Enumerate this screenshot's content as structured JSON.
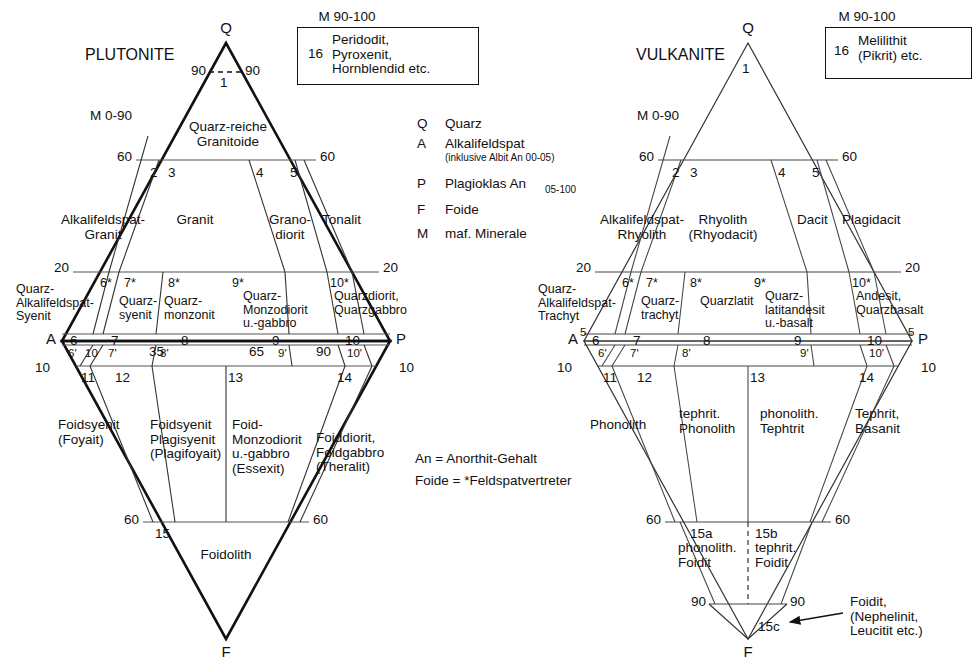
{
  "figure": {
    "type": "qapf-double-triangle",
    "left_diagram_title": "PLUTONITE",
    "right_diagram_title": "VULKANITE"
  },
  "legend": {
    "entries": [
      {
        "key": "Q",
        "text": "Quarz",
        "sub": ""
      },
      {
        "key": "A",
        "text": "Alkalifeldspat",
        "sub": "(inklusive Albit An 00-05)"
      },
      {
        "key": "P",
        "text": "Plagioklas An",
        "sub": "05-100"
      },
      {
        "key": "F",
        "text": "Foide",
        "sub": ""
      },
      {
        "key": "M",
        "text": "maf. Minerale",
        "sub": ""
      }
    ],
    "notes": [
      "An = Anorthit-Gehalt",
      "Foide = *Feldspatvertreter"
    ]
  },
  "left": {
    "title": "PLUTONITE",
    "m_top": "M 90-100",
    "m_mid": "M 0-90",
    "box_number": "16",
    "box_text": "Peridodit,\nPyroxenit,\nHornblendid etc.",
    "vertices": {
      "Q": "Q",
      "A": "A",
      "P": "P",
      "F": "F"
    },
    "ticks": {
      "q90_left": "90",
      "q90_right": "90",
      "q60_left": "60",
      "q60_right": "60",
      "q20_left": "20",
      "q20_right": "20",
      "f10_left": "10",
      "f10_right": "10",
      "f60_left": "60",
      "f60_right": "60",
      "ap_35": "35",
      "ap_65": "65",
      "ap_90": "90",
      "ap_10_left": "10"
    },
    "fields": [
      {
        "num": "1",
        "name": ""
      },
      {
        "num": "2",
        "name": "Alkalifeldspat-\nGranit"
      },
      {
        "num": "3",
        "name": "Granit"
      },
      {
        "num": "4",
        "name": "Grano-\ndiorit"
      },
      {
        "num": "5",
        "name": "Tonalit"
      },
      {
        "num": "6*",
        "name": "Quarz-\nAlkalifeldspat-\nSyenit"
      },
      {
        "num": "7*",
        "name": "Quarz-\nsyenit"
      },
      {
        "num": "8*",
        "name": "Quarz-\nmonzonit"
      },
      {
        "num": "9*",
        "name": "Quarz-\nMonzodiorit\nu.-gabbro"
      },
      {
        "num": "10*",
        "name": "Quarzdiorit,\nQuarzgabbro"
      },
      {
        "num": "6",
        "name": ""
      },
      {
        "num": "7",
        "name": ""
      },
      {
        "num": "8",
        "name": ""
      },
      {
        "num": "9",
        "name": ""
      },
      {
        "num": "10",
        "name": ""
      },
      {
        "num": "6'",
        "name": ""
      },
      {
        "num": "7'",
        "name": ""
      },
      {
        "num": "8'",
        "name": ""
      },
      {
        "num": "9'",
        "name": ""
      },
      {
        "num": "10'",
        "name": ""
      },
      {
        "num": "11",
        "name": "Foidsyenit\n(Foyait)"
      },
      {
        "num": "12",
        "name": "Foidsyenit\nPlagisyenit\n(Plagifoyait)"
      },
      {
        "num": "13",
        "name": "Foid-\nMonzodiorit\nu.-gabbro\n(Essexit)"
      },
      {
        "num": "14",
        "name": "Foiddiorit,\nFoidgabbro\n(Theralit)"
      },
      {
        "num": "15",
        "name": "Foidolith"
      }
    ],
    "top_field_label": "Quarz-reiche\nGranitoide"
  },
  "right": {
    "title": "VULKANITE",
    "m_top": "M 90-100",
    "m_mid": "M 0-90",
    "box_number": "16",
    "box_text": "Melilithit\n(Pikrit) etc.",
    "vertices": {
      "Q": "Q",
      "A": "A",
      "P": "P",
      "F": "F"
    },
    "ticks": {
      "q60_left": "60",
      "q60_right": "60",
      "q20_left": "20",
      "q20_right": "20",
      "a5": "5",
      "p5": "5",
      "f10_left": "10",
      "f10_right": "10",
      "f60_left": "60",
      "f60_right": "60",
      "f90_left": "90",
      "f90_right": "90"
    },
    "fields": [
      {
        "num": "1",
        "name": ""
      },
      {
        "num": "2",
        "name": "Alkalifeldspat-\nRhyolith"
      },
      {
        "num": "3",
        "name": "Rhyolith\n(Rhyodacit)"
      },
      {
        "num": "4",
        "name": "Dacit"
      },
      {
        "num": "5",
        "name": "Plagidacit"
      },
      {
        "num": "6*",
        "name": "Quarz-\nAlkalifeldspat-\nTrachyt"
      },
      {
        "num": "7*",
        "name": "Quarz-\ntrachyt"
      },
      {
        "num": "8*",
        "name": "Quarzlatit"
      },
      {
        "num": "9*",
        "name": "Quarz-\nlatitandesit\nu.-basalt"
      },
      {
        "num": "10*",
        "name": "Andesit,\nQuarzbasalt"
      },
      {
        "num": "6",
        "name": ""
      },
      {
        "num": "7",
        "name": ""
      },
      {
        "num": "8",
        "name": ""
      },
      {
        "num": "9",
        "name": ""
      },
      {
        "num": "10",
        "name": ""
      },
      {
        "num": "6'",
        "name": ""
      },
      {
        "num": "7'",
        "name": ""
      },
      {
        "num": "8'",
        "name": ""
      },
      {
        "num": "9'",
        "name": ""
      },
      {
        "num": "10'",
        "name": ""
      },
      {
        "num": "11",
        "name": "Phonolith"
      },
      {
        "num": "12",
        "name": "tephrit.\nPhonolith"
      },
      {
        "num": "13",
        "name": "phonolith.\nTephtrit"
      },
      {
        "num": "14",
        "name": "Tephrit,\nBasanit"
      },
      {
        "num": "15a",
        "name": "phonolith.\nFoidit"
      },
      {
        "num": "15b",
        "name": "tephrit.\nFoidit"
      },
      {
        "num": "15c",
        "name": "Foidit,\n(Nephelinit,\nLeucitit etc.)"
      }
    ]
  },
  "colors": {
    "line": "#111111",
    "thin_line": "#444444",
    "background": "#ffffff"
  }
}
